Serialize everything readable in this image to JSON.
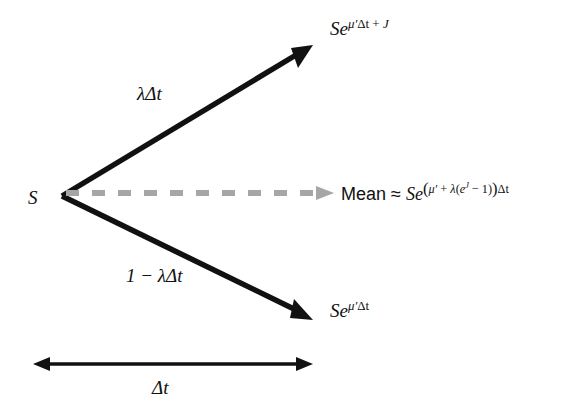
{
  "diagram": {
    "colors": {
      "background": "#ffffff",
      "stroke": "#111111",
      "mean_arrow": "#a6a6a6"
    },
    "origin": {
      "label": "S",
      "name": "initial-asset-price"
    },
    "branches": {
      "up": {
        "probability_label": "λΔt",
        "outcome": {
          "base": "Se",
          "exponent_mu": "μ′",
          "exponent_dt": "Δt",
          "exponent_plus": " + ",
          "exponent_jump": "J",
          "full": "Se^(μ′Δt + J)"
        }
      },
      "down": {
        "probability_label": "1 − λΔt",
        "outcome": {
          "base": "Se",
          "exponent_mu": "μ′",
          "exponent_dt": "Δt",
          "full": "Se^(μ′Δt)"
        }
      }
    },
    "mean": {
      "word": "Mean",
      "approx_symbol": "≈",
      "base": "Se",
      "exponent_open_paren": "(",
      "exponent_mu": "μ′",
      "exponent_plus": " + ",
      "exponent_lambda": "λ",
      "exponent_inner_open": "(",
      "exponent_e": "e",
      "exponent_jump": "J",
      "exponent_minus_one": " − 1",
      "exponent_inner_close": ")",
      "exponent_close_paren": ")",
      "exponent_dt": "Δt",
      "full": "Mean ≈ Se^((μ′ + λ(e^J − 1))Δt)"
    },
    "timespan": {
      "label": "Δt",
      "name": "time-step"
    }
  }
}
